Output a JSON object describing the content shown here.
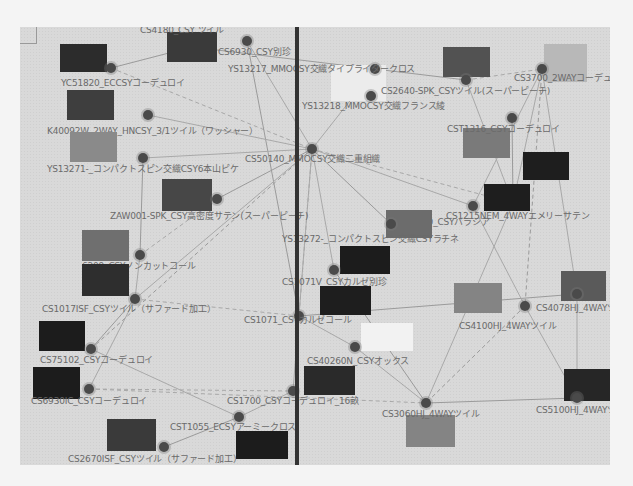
{
  "graph": {
    "title": "",
    "nodes": [
      {
        "id": "n1",
        "label": "YC51820_ECCSYコーデュロイ",
        "x": 91,
        "y": 41,
        "lx": 41,
        "ly": 49,
        "swatch": {
          "x": 40,
          "y": 17,
          "w": 47,
          "h": 28,
          "c": "#2c2c2c"
        }
      },
      {
        "id": "n2",
        "label": "CS4180_CSY ツイル",
        "x": 0,
        "y": 0,
        "lx": 120,
        "ly": -4,
        "swatch": {
          "x": 147,
          "y": 5,
          "w": 50,
          "h": 30,
          "c": "#3a3a3a"
        }
      },
      {
        "id": "n3",
        "label": "CS6930_CSY別珍",
        "x": 227,
        "y": 14,
        "lx": 198,
        "ly": 18,
        "swatch": null
      },
      {
        "id": "n4",
        "label": "YS13217_MMOCSY交織タイプライタークロス",
        "x": 355,
        "y": 42,
        "lx": 208,
        "ly": 35,
        "swatch": {
          "x": 311,
          "y": 38,
          "w": 55,
          "h": 36,
          "c": "#ececec"
        }
      },
      {
        "id": "n5",
        "label": "CS2640-SPK_CSYツイル(スーパーピーチ)",
        "x": 446,
        "y": 53,
        "lx": 361,
        "ly": 57,
        "swatch": {
          "x": 423,
          "y": 20,
          "w": 47,
          "h": 30,
          "c": "#525252"
        }
      },
      {
        "id": "n6",
        "label": "CS3700_2WAYコーデュロイ",
        "x": 522,
        "y": 42,
        "lx": 494,
        "ly": 44,
        "swatch": {
          "x": 524,
          "y": 17,
          "w": 43,
          "h": 38,
          "c": "#b8b8b8"
        }
      },
      {
        "id": "n7",
        "label": "K40092W_2WAY_HNCSY_3/1ツイル（ワッシャー）",
        "x": 128,
        "y": 88,
        "lx": 27,
        "ly": 97,
        "swatch": {
          "x": 47,
          "y": 63,
          "w": 47,
          "h": 30,
          "c": "#3e3e3e"
        }
      },
      {
        "id": "n8",
        "label": "YS13218_MMOCSY交織フランス綾",
        "x": 351,
        "y": 69,
        "lx": 282,
        "ly": 72,
        "swatch": null
      },
      {
        "id": "n9",
        "label": "CST1316_CSYコーデュロイ",
        "x": 492,
        "y": 91,
        "lx": 427,
        "ly": 95,
        "swatch": {
          "x": 443,
          "y": 101,
          "w": 47,
          "h": 30,
          "c": "#7a7a7a"
        }
      },
      {
        "id": "n10",
        "label": "YS13271-_コンパクトスピン交織CSY6本山ピケ",
        "x": 123,
        "y": 131,
        "lx": 27,
        "ly": 135,
        "swatch": {
          "x": 50,
          "y": 105,
          "w": 47,
          "h": 30,
          "c": "#8a8a8a"
        }
      },
      {
        "id": "n11",
        "label": "CS50140_MMOCSY交織二重組織",
        "x": 292,
        "y": 122,
        "lx": 225,
        "ly": 125,
        "swatch": null
      },
      {
        "id": "n12",
        "label": "CS1215NEM_4WAYエメリーサテン",
        "x": 493,
        "y": 176,
        "lx": 426,
        "ly": 182,
        "swatch": {
          "x": 503,
          "y": 125,
          "w": 46,
          "h": 28,
          "c": "#1e1e1e"
        }
      },
      {
        "id": "n13",
        "label": "ZAW001-SPK_CSY高密度サテン(スーパーピーチ)",
        "x": 197,
        "y": 172,
        "lx": 90,
        "ly": 182,
        "swatch": {
          "x": 142,
          "y": 152,
          "w": 50,
          "h": 32,
          "c": "#474747"
        }
      },
      {
        "id": "n14",
        "label": "BN21140_CSYバラシア",
        "x": 453,
        "y": 179,
        "lx": 373,
        "ly": 188,
        "swatch": {
          "x": 464,
          "y": 157,
          "w": 46,
          "h": 27,
          "c": "#1e1e1e"
        }
      },
      {
        "id": "n15",
        "label": "YS13272-_コンパクトスピン交織CSYラチネ",
        "x": 371,
        "y": 197,
        "lx": 262,
        "ly": 205,
        "swatch": {
          "x": 366,
          "y": 183,
          "w": 46,
          "h": 28,
          "c": "#6c6c6c"
        }
      },
      {
        "id": "n16",
        "label": "6209_CSYノンカットコール",
        "x": 120,
        "y": 228,
        "lx": 62,
        "ly": 232,
        "swatch": {
          "x": 62,
          "y": 203,
          "w": 47,
          "h": 31,
          "c": "#6f6f6f"
        }
      },
      {
        "id": "n17",
        "label": "CS1071V_CSYカルゼ別珍",
        "x": 314,
        "y": 243,
        "lx": 262,
        "ly": 248,
        "swatch": {
          "x": 320,
          "y": 219,
          "w": 50,
          "h": 28,
          "c": "#1c1c1c"
        }
      },
      {
        "id": "n18",
        "label": "CS1017ISF_CSYツイル（サファード加工）",
        "x": 115,
        "y": 272,
        "lx": 22,
        "ly": 275,
        "swatch": {
          "x": 62,
          "y": 237,
          "w": 47,
          "h": 32,
          "c": "#2e2e2e"
        }
      },
      {
        "id": "n19",
        "label": "CS1071_CSYカルゼコール",
        "x": 279,
        "y": 289,
        "lx": 224,
        "ly": 286,
        "swatch": {
          "x": 300,
          "y": 259,
          "w": 51,
          "h": 29,
          "c": "#1e1e1e"
        }
      },
      {
        "id": "n20",
        "label": "CS4078HJ_4WAYツイル",
        "x": 557,
        "y": 267,
        "lx": 516,
        "ly": 274,
        "swatch": {
          "x": 541,
          "y": 244,
          "w": 45,
          "h": 30,
          "c": "#5a5a5a"
        }
      },
      {
        "id": "n21",
        "label": "CS4100HJ_4WAYツイル",
        "x": 505,
        "y": 279,
        "lx": 439,
        "ly": 292,
        "swatch": {
          "x": 434,
          "y": 256,
          "w": 48,
          "h": 30,
          "c": "#848484"
        }
      },
      {
        "id": "n22",
        "label": "CS75102_CSYコーデュロイ",
        "x": 71,
        "y": 322,
        "lx": 20,
        "ly": 326,
        "swatch": {
          "x": 19,
          "y": 294,
          "w": 46,
          "h": 30,
          "c": "#1c1c1c"
        }
      },
      {
        "id": "n23",
        "label": "CS40260N_CSYオックス",
        "x": 335,
        "y": 320,
        "lx": 287,
        "ly": 327,
        "swatch": {
          "x": 341,
          "y": 296,
          "w": 52,
          "h": 28,
          "c": "#f2f2f2"
        }
      },
      {
        "id": "n24",
        "label": "CS6930IC_CSYコーデュロイ",
        "x": 69,
        "y": 362,
        "lx": 11,
        "ly": 367,
        "swatch": {
          "x": 13,
          "y": 340,
          "w": 47,
          "h": 32,
          "c": "#1c1c1c"
        }
      },
      {
        "id": "n25",
        "label": "CS1700_CSYコーデュロイ_16畝",
        "x": 273,
        "y": 364,
        "lx": 207,
        "ly": 367,
        "swatch": {
          "x": 284,
          "y": 339,
          "w": 51,
          "h": 29,
          "c": "#2a2a2a"
        }
      },
      {
        "id": "n26",
        "label": "CS3060HJ_4WAYツイル",
        "x": 406,
        "y": 376,
        "lx": 362,
        "ly": 380,
        "swatch": {
          "x": 386,
          "y": 388,
          "w": 49,
          "h": 32,
          "c": "#848484"
        }
      },
      {
        "id": "n27",
        "label": "CS5100HJ_4WAYツイル",
        "x": 557,
        "y": 371,
        "lx": 516,
        "ly": 376,
        "swatch": {
          "x": 544,
          "y": 342,
          "w": 46,
          "h": 32,
          "c": "#262626"
        }
      },
      {
        "id": "n28",
        "label": "CST1055_ECSYアーミークロス",
        "x": 219,
        "y": 390,
        "lx": 150,
        "ly": 393,
        "swatch": {
          "x": 216,
          "y": 404,
          "w": 52,
          "h": 28,
          "c": "#1c1c1c"
        }
      },
      {
        "id": "n29",
        "label": "CS2670ISF_CSYツイル（サファード加工）",
        "x": 144,
        "y": 420,
        "lx": 48,
        "ly": 425,
        "swatch": {
          "x": 87,
          "y": 392,
          "w": 49,
          "h": 32,
          "c": "#3a3a3a"
        }
      }
    ],
    "edges": [
      [
        "n1",
        "n2"
      ],
      [
        "n1",
        "n11"
      ],
      [
        "n3",
        "n11"
      ],
      [
        "n3",
        "n19"
      ],
      [
        "n4",
        "n11"
      ],
      [
        "n5",
        "n6"
      ],
      [
        "n2",
        "n5"
      ],
      [
        "n6",
        "n12"
      ],
      [
        "n6",
        "n14"
      ],
      [
        "n6",
        "n21"
      ],
      [
        "n6",
        "n20"
      ],
      [
        "n5",
        "n12"
      ],
      [
        "n9",
        "n12"
      ],
      [
        "n11",
        "n12"
      ],
      [
        "n11",
        "n14"
      ],
      [
        "n11",
        "n15"
      ],
      [
        "n11",
        "n17"
      ],
      [
        "n11",
        "n19"
      ],
      [
        "n11",
        "n13"
      ],
      [
        "n11",
        "n10"
      ],
      [
        "n11",
        "n18"
      ],
      [
        "n11",
        "n22"
      ],
      [
        "n11",
        "n25"
      ],
      [
        "n7",
        "n11"
      ],
      [
        "n10",
        "n16"
      ],
      [
        "n13",
        "n16"
      ],
      [
        "n16",
        "n18"
      ],
      [
        "n18",
        "n22"
      ],
      [
        "n18",
        "n24"
      ],
      [
        "n18",
        "n19"
      ],
      [
        "n19",
        "n20"
      ],
      [
        "n19",
        "n23"
      ],
      [
        "n23",
        "n26"
      ],
      [
        "n21",
        "n26"
      ],
      [
        "n21",
        "n27"
      ],
      [
        "n20",
        "n27"
      ],
      [
        "n26",
        "n27"
      ],
      [
        "n24",
        "n25"
      ],
      [
        "n25",
        "n28"
      ],
      [
        "n28",
        "n29"
      ],
      [
        "n22",
        "n28"
      ],
      [
        "n24",
        "n26"
      ],
      [
        "n17",
        "n26"
      ],
      [
        "n12",
        "n26"
      ],
      [
        "n14",
        "n21"
      ]
    ]
  },
  "divider": {
    "x": 277
  }
}
